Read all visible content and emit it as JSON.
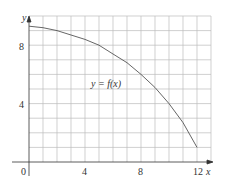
{
  "chart_data": {
    "type": "line",
    "title": "",
    "xlabel": "x",
    "ylabel": "y",
    "xlim": [
      0,
      13
    ],
    "ylim": [
      0,
      10
    ],
    "grid": true,
    "x_ticks": [
      0,
      4,
      8,
      12
    ],
    "y_ticks": [
      4,
      8
    ],
    "origin_label": "0",
    "annotation": "y = f(x)",
    "series": [
      {
        "name": "y = f(x)",
        "x": [
          0,
          1,
          2,
          3,
          4,
          5,
          6,
          7,
          8,
          9,
          10,
          11,
          12
        ],
        "y": [
          9.3,
          9.2,
          9.0,
          8.7,
          8.4,
          8.0,
          7.4,
          6.8,
          6.0,
          5.1,
          4.0,
          2.7,
          1.0
        ]
      }
    ]
  },
  "labels": {
    "x_axis": "x",
    "y_axis": "y",
    "origin": "0",
    "x_tick_4": "4",
    "x_tick_8": "8",
    "x_tick_12": "12",
    "y_tick_4": "4",
    "y_tick_8": "8",
    "curve": "y = f(x)"
  }
}
